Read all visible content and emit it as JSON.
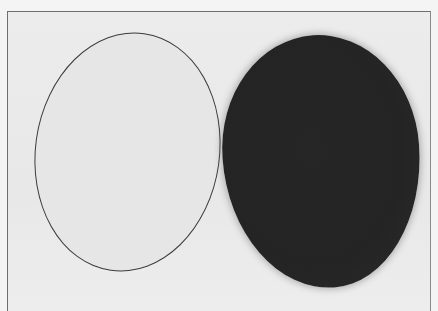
{
  "image": {
    "description": "Photograph of two oval shapes on a light background: an outlined light oval on the left and a solid dark filled oval on the right",
    "background_color": "#eaeaea",
    "shapes": [
      {
        "name": "light-oval",
        "fill": "#e6e6e6",
        "outline": "#3a3a3a"
      },
      {
        "name": "dark-oval",
        "fill": "#252525"
      }
    ]
  }
}
